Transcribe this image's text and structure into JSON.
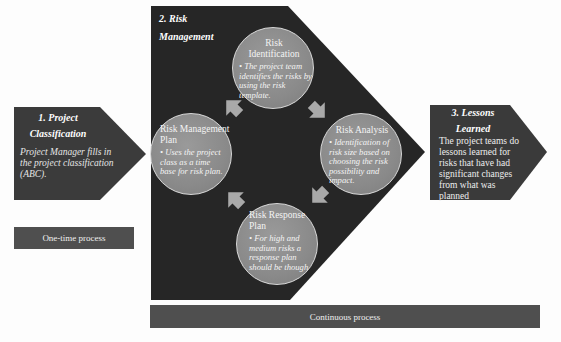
{
  "stages": {
    "project_classification": {
      "title_line1": "1. Project",
      "title_line2": "Classification",
      "body": "Project Manager fills in the project classification (ABC)."
    },
    "risk_management": {
      "title_line1": "2. Risk",
      "title_line2": "Management"
    },
    "lessons_learned": {
      "title_line1": "3. Lessons",
      "title_line2": "Learned",
      "body": "The project teams do lessons learned for risks that have had significant changes from what was planned"
    }
  },
  "cycle": {
    "identification": {
      "title": "Risk Identification",
      "bullet": "The project team identifies the risks by using the risk template."
    },
    "analysis": {
      "title": "Risk Analysis",
      "bullet": "Identification of risk size based on choosing the risk possibility and impact."
    },
    "response": {
      "title": "Risk Response Plan",
      "bullet": "For high and medium risks a response plan should be though"
    },
    "management_plan": {
      "title": "Risk Management Plan",
      "bullet": "Uses the project class as a time base for risk plan."
    }
  },
  "bars": {
    "one_time": "One-time process",
    "continuous": "Continuous process"
  },
  "colors": {
    "shape_dark": "#3a3a3a",
    "big_shape": "#262626",
    "circle": "#8e8e8e",
    "arrow": "#a9a9a9",
    "bar": "#4f4f4f"
  }
}
